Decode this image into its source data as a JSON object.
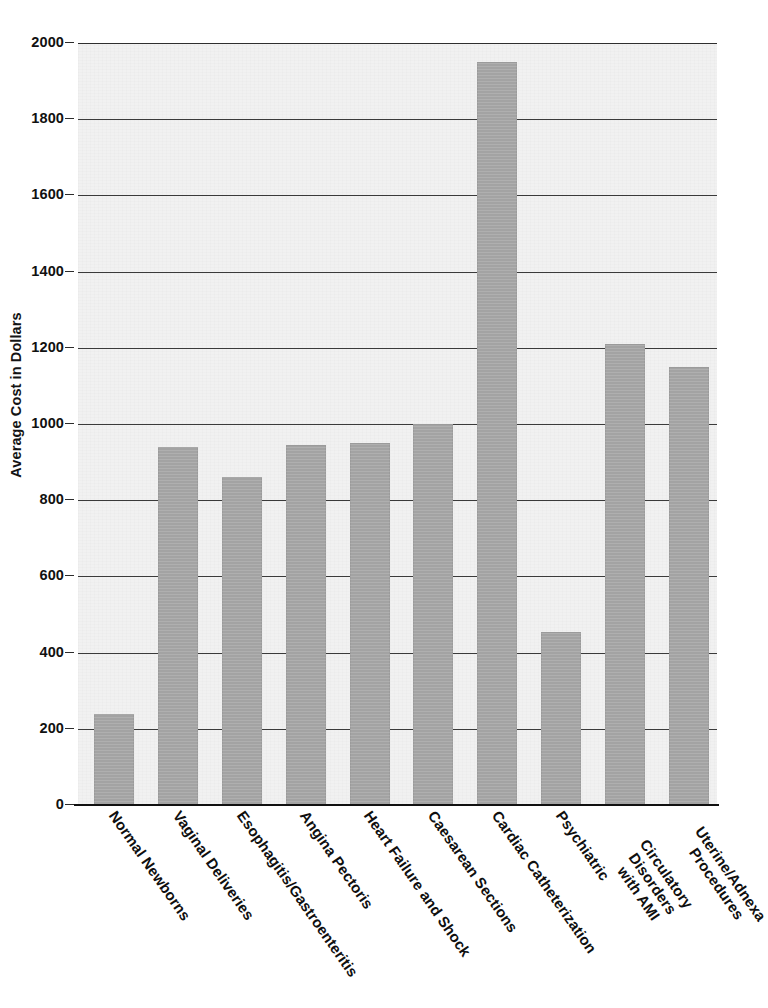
{
  "chart_data": {
    "type": "bar",
    "title": "",
    "xlabel": "",
    "ylabel": "Average Cost in Dollars",
    "ylim": [
      0,
      2000
    ],
    "ytick_step": 200,
    "yticks": [
      "0",
      "200",
      "400",
      "600",
      "800",
      "1000",
      "1200",
      "1400",
      "1600",
      "1800",
      "2000"
    ],
    "grid": true,
    "legend": "none",
    "bar_color": "#a6a6a6",
    "plot_background": "#f1f1f1",
    "categories": [
      "Normal Newborns",
      "Vaginal Deliveries",
      "Esophagitis/Gastroenteritis",
      "Angina Pectoris",
      "Heart Failure and Shock",
      "Caesarean Sections",
      "Cardiac Catheterization",
      "Psychiatric",
      "Circulatory Disorders with AMI",
      "Uterine/Adnexa Procedures"
    ],
    "category_lines": [
      [
        "Normal Newborns"
      ],
      [
        "Vaginal Deliveries"
      ],
      [
        "Esophagitis/Gastroenteritis"
      ],
      [
        "Angina Pectoris"
      ],
      [
        "Heart Failure and Shock"
      ],
      [
        "Caesarean Sections"
      ],
      [
        "Cardiac Catheterization"
      ],
      [
        "Psychiatric"
      ],
      [
        "Circulatory Disorders",
        "with AMI"
      ],
      [
        "Uterine/Adnexa",
        "Procedures"
      ]
    ],
    "values": [
      240,
      940,
      860,
      945,
      950,
      1000,
      1950,
      455,
      1210,
      1150
    ]
  },
  "axis": {
    "y_title": "Average Cost in Dollars",
    "ticks": [
      {
        "value": 2000,
        "label": "2000"
      },
      {
        "value": 1800,
        "label": "1800"
      },
      {
        "value": 1600,
        "label": "1600"
      },
      {
        "value": 1400,
        "label": "1400"
      },
      {
        "value": 1200,
        "label": "1200"
      },
      {
        "value": 1000,
        "label": "1000"
      },
      {
        "value": 800,
        "label": "800"
      },
      {
        "value": 600,
        "label": "600"
      },
      {
        "value": 400,
        "label": "400"
      },
      {
        "value": 200,
        "label": "200"
      },
      {
        "value": 0,
        "label": "0"
      }
    ]
  },
  "header": {
    "title_fragment": ""
  }
}
